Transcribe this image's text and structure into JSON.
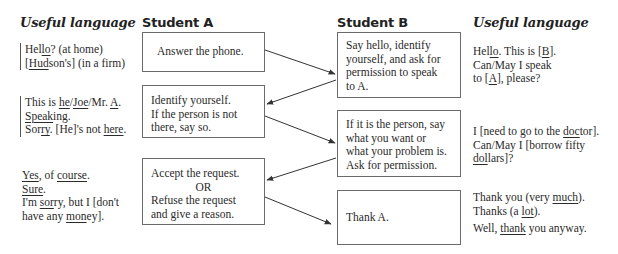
{
  "headers": {
    "useful_language_left": "Useful language",
    "student_a": "Student A",
    "student_b": "Student B",
    "useful_language_right": "Useful language"
  },
  "student_a": {
    "box1": [
      "Answer the phone."
    ],
    "box2": [
      "Identify yourself.",
      "If the person is not",
      "there, say so."
    ],
    "box3": [
      "Accept the request.",
      "OR",
      "Refuse the request",
      "and give a reason."
    ]
  },
  "student_b": {
    "box1": [
      "Say hello, identify",
      "yourself, and ask for",
      "permission to speak",
      "to A."
    ],
    "box2": [
      "If it is the person, say",
      "what you want or",
      "what your problem is.",
      "Ask for permission."
    ],
    "box3": [
      "Thank A."
    ]
  },
  "useful_language_left": {
    "group1": [
      "Hello? (at home)",
      "[Hudson's] (in a firm)"
    ],
    "group2": [
      "This is he/Joe/Mr. A.",
      "Speaking.",
      "Sorry. [He]'s not here."
    ],
    "group3": [
      "Yes, of course.",
      "Sure.",
      "I'm sorry, but I [don't",
      "have any money]."
    ]
  },
  "useful_language_right": {
    "group1": [
      "Hello. This is [B].",
      "Can/May I speak",
      "to [A], please?"
    ],
    "group2": [
      "I [need to go to the doctor].",
      "Can/May I [borrow fifty",
      "dollars]?"
    ],
    "group3": [
      "Thank you (very much).",
      "Thanks (a lot).",
      "Well, thank you anyway."
    ]
  },
  "colors": {
    "text": "#2a2a2a",
    "border": "#6b6b6b",
    "arrow": "#333333"
  }
}
